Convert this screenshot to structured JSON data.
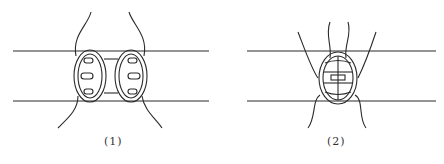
{
  "diagram": {
    "figures": [
      {
        "id": "fig1",
        "caption": "(1)",
        "description": "Two separate suture rings with three stitches each, on parallel lines"
      },
      {
        "id": "fig2",
        "caption": "(2)",
        "description": "Single combined suture ring with tied stitches, on parallel lines"
      }
    ]
  },
  "colors": {
    "stroke": "#2a2a2a",
    "background": "#ffffff"
  }
}
